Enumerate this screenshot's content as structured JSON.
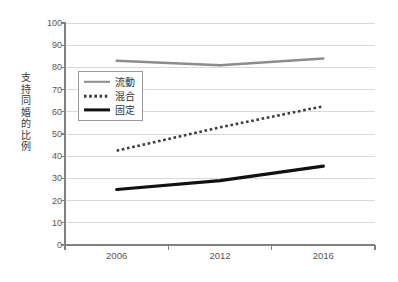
{
  "chart_data": {
    "type": "line",
    "title": "",
    "subtitle": "",
    "xlabel": "",
    "ylabel": "支持同婚的比例",
    "categories": [
      "2006",
      "2012",
      "2016"
    ],
    "x": [
      2006,
      2012,
      2016
    ],
    "ylim": [
      0,
      100
    ],
    "y_ticks": [
      0,
      10,
      20,
      30,
      40,
      50,
      60,
      70,
      80,
      90,
      100
    ],
    "y_tick_labels": [
      "0",
      "10",
      "20",
      "30",
      "40",
      "50",
      "60",
      "70",
      "80",
      "90",
      "100"
    ],
    "grid": true,
    "grid_axis": "y",
    "legend_position": "inside-upper-left",
    "series": [
      {
        "name": "流動",
        "values": [
          83,
          81,
          84
        ],
        "style": "solid",
        "color": "#8c8c8c",
        "width": 2.4
      },
      {
        "name": "混合",
        "values": [
          42.5,
          53,
          62.5
        ],
        "style": "dotted",
        "color": "#3b3b3b",
        "width": 2.6
      },
      {
        "name": "固定",
        "values": [
          25,
          29,
          35.5
        ],
        "style": "solid",
        "color": "#111111",
        "width": 3.2
      }
    ]
  },
  "legend": {
    "items": [
      {
        "label": "流動"
      },
      {
        "label": "混合"
      },
      {
        "label": "固定"
      }
    ]
  },
  "axes": {
    "y_title": "支持同婚的比例",
    "x_tick_labels": [
      "2006",
      "2012",
      "2016"
    ],
    "y_tick_labels": [
      "100",
      "90",
      "80",
      "70",
      "60",
      "50",
      "40",
      "30",
      "20",
      "10",
      "0"
    ]
  },
  "colors": {
    "grid": "#d9d9d9",
    "axis": "#808080",
    "series_fluid": "#8c8c8c",
    "series_mixed": "#3b3b3b",
    "series_fixed": "#111111",
    "text": "#555555",
    "background": "#ffffff"
  }
}
